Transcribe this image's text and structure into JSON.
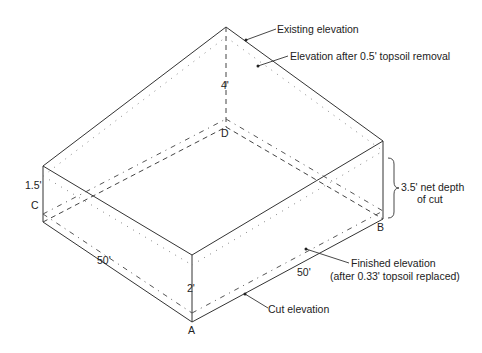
{
  "diagram": {
    "corners": {
      "A": "A",
      "B": "B",
      "C": "C",
      "D": "D"
    },
    "dimensions": {
      "front_left_length": "50'",
      "front_right_length": "50'",
      "depth_at_A": "2'",
      "depth_at_C": "1.5'",
      "depth_at_D": "4'"
    },
    "callouts": {
      "existing_elevation": "Existing elevation",
      "topsoil_removal": "Elevation after 0.5' topsoil removal",
      "net_depth_line1": "3.5' net depth",
      "net_depth_line2": "of cut",
      "finished_line1": "Finished elevation",
      "finished_line2": "(after 0.33' topsoil replaced)",
      "cut_elevation": "Cut elevation"
    }
  }
}
